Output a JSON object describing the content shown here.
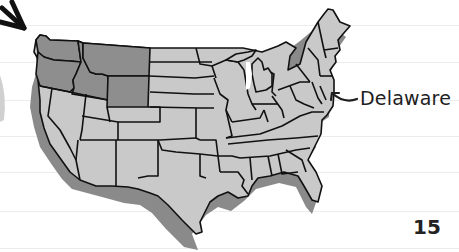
{
  "page": {
    "page_number": "15",
    "ruled_lines_y": [
      25,
      62,
      100,
      136,
      172,
      211,
      248
    ]
  },
  "map": {
    "subject": "United States map",
    "highlighted_states": [
      "Washington",
      "Oregon",
      "Idaho",
      "Montana",
      "Wyoming"
    ],
    "callout_label": "Delaware",
    "colors": {
      "state_fill": "#c9c9c9",
      "highlight_fill": "#8e8e8e",
      "shadow": "#8a8a8a",
      "outline": "#111111",
      "rule_line": "#ececec"
    }
  },
  "annotations": {
    "top_left_arrow": "arrow-pointing-down-right",
    "delaware_arrow": "curved-arrow-pointing-left"
  }
}
